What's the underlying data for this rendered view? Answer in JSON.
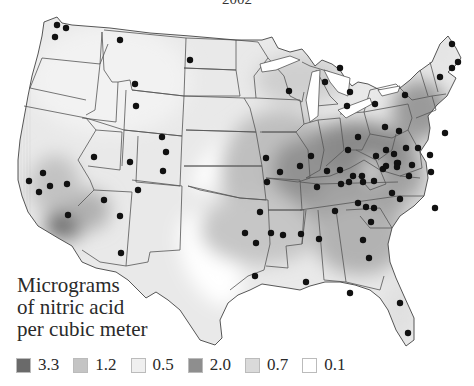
{
  "title": "2002",
  "legend": {
    "title_lines": [
      "Micrograms",
      "of nitric acid",
      "per cubic meter"
    ],
    "items": [
      {
        "label": "3.3",
        "color": "#6a6a6a"
      },
      {
        "label": "1.2",
        "color": "#c4c4c4"
      },
      {
        "label": "0.5",
        "color": "#efefef"
      },
      {
        "label": "2.0",
        "color": "#8e8e8e"
      },
      {
        "label": "0.7",
        "color": "#dadada"
      },
      {
        "label": "0.1",
        "color": "#ffffff"
      }
    ]
  },
  "map": {
    "region": "Contiguous United States",
    "marker": "monitoring-station",
    "stations": [
      [
        57,
        25
      ],
      [
        66,
        28
      ],
      [
        55,
        37
      ],
      [
        120,
        40
      ],
      [
        190,
        60
      ],
      [
        135,
        84
      ],
      [
        136,
        106
      ],
      [
        162,
        137
      ],
      [
        166,
        152
      ],
      [
        39,
        192
      ],
      [
        43,
        173
      ],
      [
        29,
        181
      ],
      [
        50,
        186
      ],
      [
        67,
        184
      ],
      [
        94,
        157
      ],
      [
        130,
        162
      ],
      [
        138,
        190
      ],
      [
        104,
        200
      ],
      [
        121,
        253
      ],
      [
        120,
        216
      ],
      [
        163,
        171
      ],
      [
        68,
        215
      ],
      [
        289,
        91
      ],
      [
        325,
        82
      ],
      [
        347,
        106
      ],
      [
        375,
        104
      ],
      [
        340,
        68
      ],
      [
        350,
        92
      ],
      [
        385,
        127
      ],
      [
        405,
        95
      ],
      [
        440,
        77
      ],
      [
        452,
        68
      ],
      [
        452,
        44
      ],
      [
        458,
        62
      ],
      [
        399,
        131
      ],
      [
        386,
        150
      ],
      [
        445,
        133
      ],
      [
        406,
        148
      ],
      [
        418,
        148
      ],
      [
        394,
        154
      ],
      [
        430,
        155
      ],
      [
        412,
        165
      ],
      [
        300,
        166
      ],
      [
        311,
        156
      ],
      [
        327,
        171
      ],
      [
        362,
        176
      ],
      [
        340,
        170
      ],
      [
        348,
        150
      ],
      [
        266,
        158
      ],
      [
        358,
        137
      ],
      [
        349,
        182
      ],
      [
        376,
        156
      ],
      [
        383,
        169
      ],
      [
        398,
        163
      ],
      [
        431,
        172
      ],
      [
        409,
        176
      ],
      [
        392,
        193
      ],
      [
        363,
        182
      ],
      [
        317,
        187
      ],
      [
        397,
        163
      ],
      [
        386,
        166
      ],
      [
        358,
        203
      ],
      [
        374,
        208
      ],
      [
        335,
        211
      ],
      [
        353,
        176
      ],
      [
        283,
        235
      ],
      [
        280,
        172
      ],
      [
        374,
        181
      ],
      [
        371,
        222
      ],
      [
        397,
        167
      ],
      [
        341,
        184
      ],
      [
        400,
        199
      ],
      [
        366,
        207
      ],
      [
        435,
        208
      ],
      [
        260,
        212
      ],
      [
        271,
        233
      ],
      [
        301,
        234
      ],
      [
        306,
        282
      ],
      [
        350,
        293
      ],
      [
        256,
        243
      ],
      [
        267,
        182
      ],
      [
        255,
        276
      ],
      [
        245,
        233
      ],
      [
        408,
        333
      ],
      [
        400,
        303
      ],
      [
        363,
        240
      ],
      [
        369,
        258
      ],
      [
        319,
        239
      ]
    ]
  }
}
